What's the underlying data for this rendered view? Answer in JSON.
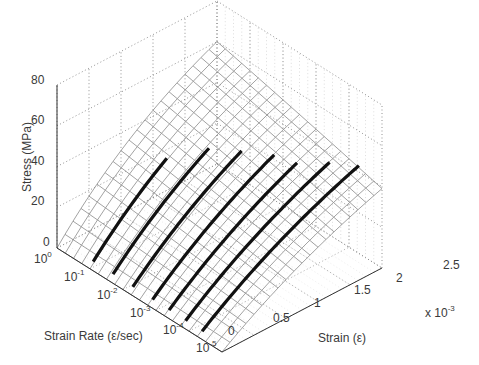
{
  "chart_data": {
    "type": "surface3d",
    "title": "",
    "xlabel": "Strain (ε)",
    "x_multiplier": "x 10^-3",
    "ylabel": "Strain Rate (ε/sec)",
    "zlabel": "Stress (MPa)",
    "x_ticks": [
      "0",
      "0.5",
      "1",
      "1.5",
      "2",
      "2.5"
    ],
    "x_range": [
      0,
      2.5
    ],
    "y_ticks": [
      "10^0",
      "10^-1",
      "10^-2",
      "10^-3",
      "10^-4",
      "10^-5"
    ],
    "y_range_log10": [
      0,
      -5
    ],
    "z_ticks": [
      "0",
      "20",
      "40",
      "60",
      "80"
    ],
    "z_range": [
      0,
      80
    ],
    "grid": true,
    "surface": "wireframe mesh of fitted stress vs strain and log strain rate; stress increases with strain (concave) and with strain rate",
    "series": [
      {
        "name": "test 1",
        "strain_rate_log10": -1.0,
        "strain_end": 1.25,
        "stress_end": 50
      },
      {
        "name": "test 2",
        "strain_rate_log10": -1.6,
        "strain_end": 1.6,
        "stress_end": 52
      },
      {
        "name": "test 3",
        "strain_rate_log10": -2.2,
        "strain_end": 1.8,
        "stress_end": 48
      },
      {
        "name": "test 4",
        "strain_rate_log10": -2.8,
        "strain_end": 2.0,
        "stress_end": 45
      },
      {
        "name": "test 5",
        "strain_rate_log10": -3.3,
        "strain_end": 2.1,
        "stress_end": 42
      },
      {
        "name": "test 6",
        "strain_rate_log10": -3.8,
        "strain_end": 2.3,
        "stress_end": 40
      },
      {
        "name": "test 7",
        "strain_rate_log10": -4.3,
        "strain_end": 2.5,
        "stress_end": 38
      }
    ]
  },
  "labels": {
    "zlabel": "Stress (MPa)",
    "ylabel": "Strain Rate (ε/sec)",
    "xlabel": "Strain (ε)",
    "x_mult_base": "x 10",
    "x_mult_exp": "-3"
  },
  "ticks": {
    "z": [
      "80",
      "60",
      "40",
      "20",
      "0"
    ],
    "y_base": "10",
    "y_exp": [
      "0",
      "-1",
      "-2",
      "-3",
      "-4",
      "-5"
    ],
    "x": [
      "0",
      "0.5",
      "1",
      "1.5",
      "2",
      "2.5"
    ]
  }
}
